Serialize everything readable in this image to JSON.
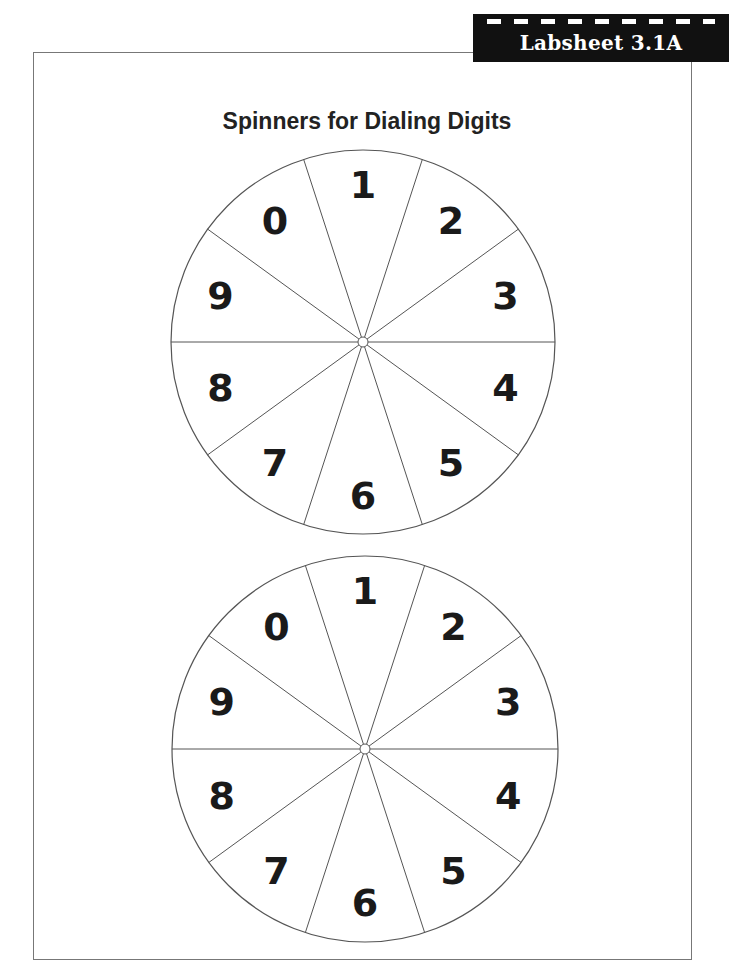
{
  "header": {
    "label": "Labsheet 3.1A"
  },
  "page": {
    "title": "Spinners for Dialing Digits"
  },
  "spinners": [
    {
      "name": "spinner-1",
      "cx": 363,
      "cy": 342,
      "r": 192,
      "digits": [
        "1",
        "2",
        "3",
        "4",
        "5",
        "6",
        "7",
        "8",
        "9",
        "0"
      ]
    },
    {
      "name": "spinner-2",
      "cx": 365,
      "cy": 749,
      "r": 193,
      "digits": [
        "1",
        "2",
        "3",
        "4",
        "5",
        "6",
        "7",
        "8",
        "9",
        "0"
      ]
    }
  ],
  "colors": {
    "label_bg": "#111111",
    "label_text": "#ffffff",
    "line": "#555555",
    "digit": "#1a1a1a"
  }
}
